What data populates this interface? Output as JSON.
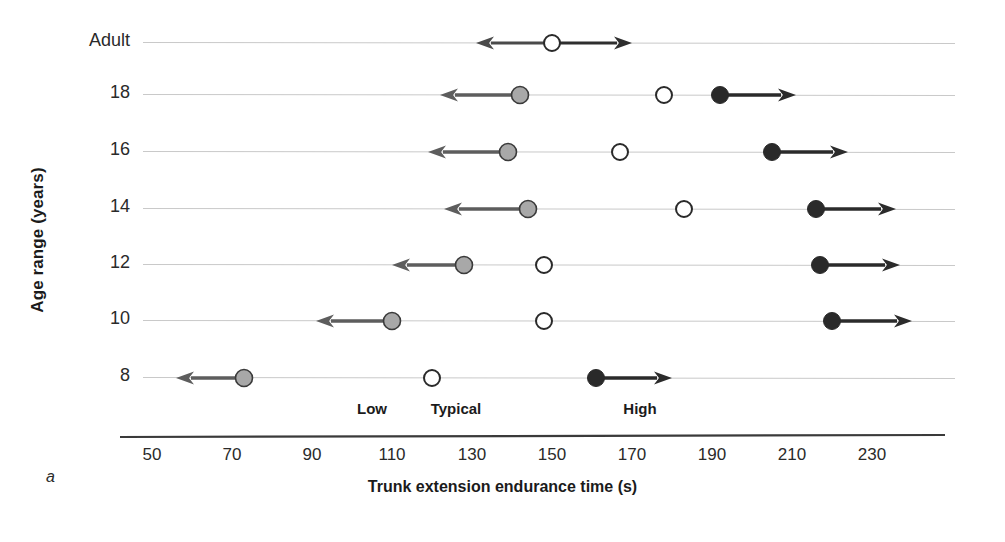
{
  "figure": {
    "panel_letter": "a",
    "background": "#ffffff"
  },
  "axes": {
    "y_title": "Age range (years)",
    "x_title": "Trunk extension endurance time (s)",
    "x_ticks": [
      50,
      70,
      90,
      110,
      130,
      150,
      170,
      190,
      210,
      230
    ],
    "x_min": 50,
    "x_max": 240,
    "y_categories": [
      "Adult",
      "18",
      "16",
      "14",
      "12",
      "10",
      "8"
    ]
  },
  "zone_labels": [
    {
      "text": "Low",
      "x": 105
    },
    {
      "text": "Typical",
      "x": 126
    },
    {
      "text": "High",
      "x": 172
    }
  ],
  "legend_markers": {
    "low": {
      "name": "gray-filled-circle",
      "fill": "#a8a8a8",
      "stroke": "#3a3a3a"
    },
    "typical": {
      "name": "open-circle",
      "fill": "#ffffff",
      "stroke": "#2a2a2a"
    },
    "high": {
      "name": "black-filled-circle",
      "fill": "#2a2a2a",
      "stroke": "#2a2a2a"
    }
  },
  "chart_data": {
    "type": "scatter",
    "title": "",
    "subtitle": "",
    "xlabel": "Trunk extension endurance time (s)",
    "ylabel": "Age range (years)",
    "xlim": [
      50,
      240
    ],
    "grid": false,
    "legend_position": "below-plot",
    "categories": [
      "Adult",
      "18",
      "16",
      "14",
      "12",
      "10",
      "8"
    ],
    "series": [
      {
        "name": "Low",
        "marker": "gray-filled-circle",
        "arrow": "left",
        "values": [
          null,
          142,
          139,
          144,
          128,
          110,
          73
        ],
        "arrow_ends": [
          null,
          122,
          119,
          123,
          110,
          91,
          56
        ]
      },
      {
        "name": "Typical",
        "marker": "open-circle",
        "arrow": "both",
        "values": [
          150,
          178,
          167,
          183,
          148,
          148,
          120
        ],
        "arrow_ends": [
          [
            131,
            170
          ],
          null,
          null,
          null,
          null,
          null,
          null
        ]
      },
      {
        "name": "High",
        "marker": "black-filled-circle",
        "arrow": "right",
        "values": [
          null,
          192,
          205,
          216,
          217,
          220,
          161
        ],
        "arrow_ends": [
          null,
          211,
          224,
          236,
          237,
          240,
          180
        ]
      }
    ],
    "rows": [
      {
        "category": "Adult",
        "low": null,
        "low_arrow_end": null,
        "typical": 150,
        "typical_arrow_left": 131,
        "typical_arrow_right": 170,
        "high": null,
        "high_arrow_end": null
      },
      {
        "category": "18",
        "low": 142,
        "low_arrow_end": 122,
        "typical": 178,
        "typical_arrow_left": null,
        "typical_arrow_right": null,
        "high": 192,
        "high_arrow_end": 211
      },
      {
        "category": "16",
        "low": 139,
        "low_arrow_end": 119,
        "typical": 167,
        "typical_arrow_left": null,
        "typical_arrow_right": null,
        "high": 205,
        "high_arrow_end": 224
      },
      {
        "category": "14",
        "low": 144,
        "low_arrow_end": 123,
        "typical": 183,
        "typical_arrow_left": null,
        "typical_arrow_right": null,
        "high": 216,
        "high_arrow_end": 236
      },
      {
        "category": "12",
        "low": 128,
        "low_arrow_end": 110,
        "typical": 148,
        "typical_arrow_left": null,
        "typical_arrow_right": null,
        "high": 217,
        "high_arrow_end": 237
      },
      {
        "category": "10",
        "low": 110,
        "low_arrow_end": 91,
        "typical": 148,
        "typical_arrow_left": null,
        "typical_arrow_right": null,
        "high": 220,
        "high_arrow_end": 240
      },
      {
        "category": "8",
        "low": 73,
        "low_arrow_end": 56,
        "typical": 120,
        "typical_arrow_left": null,
        "typical_arrow_right": null,
        "high": 161,
        "high_arrow_end": 180
      }
    ]
  }
}
